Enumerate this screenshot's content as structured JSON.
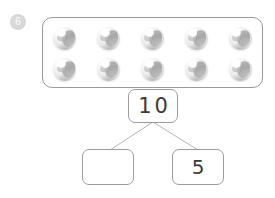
{
  "worksheet": {
    "question_number": "6",
    "tray": {
      "label": "marble-tray",
      "rows": [
        {
          "marbles": [
            "marble",
            "marble",
            "marble",
            "marble",
            "marble"
          ]
        },
        {
          "marbles": [
            "marble",
            "marble",
            "marble",
            "marble",
            "marble"
          ]
        }
      ],
      "total_count": 10
    },
    "number_bond": {
      "whole": "10",
      "parts": [
        {
          "value": "",
          "filled": false
        },
        {
          "value": "5",
          "filled": true
        }
      ]
    },
    "colors": {
      "outline": "#9a9a9a",
      "badge_fill": "#d8d8d8",
      "badge_text": "#ffffff",
      "digit": "#3a3a3a",
      "connector": "#b5b5b5",
      "page_background": "#ffffff"
    }
  }
}
